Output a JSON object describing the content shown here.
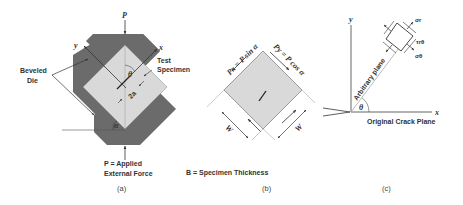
{
  "colors": {
    "die": "#6b6b6b",
    "specimen": "#d9d9d9",
    "line": "#333333",
    "text": "#333333",
    "background": "#ffffff"
  },
  "panel_a": {
    "force_top_label": "P",
    "axis_y_label": "y",
    "axis_x_label": "x",
    "die_label_line1": "Beveled",
    "die_label_line2": "Die",
    "specimen_label_line1": "Test",
    "specimen_label_line2": "Specimen",
    "angle_theta_label": "θ",
    "crack_length_label": "2a",
    "angle_alpha_label": "α",
    "force_def_line1": "P = Applied",
    "force_def_line2": "External Force",
    "caption": "(a)"
  },
  "panel_b": {
    "force_x_label": "Px = P sin α",
    "force_y_label": "Py = P cos α",
    "width_left_label": "W",
    "width_right_label": "W",
    "thickness_def": "B = Specimen Thickness",
    "caption": "(b)"
  },
  "panel_c": {
    "axis_y_label": "y",
    "axis_x_label": "x",
    "arbitrary_plane_label": "Arbitrary plane",
    "theta_label": "θ",
    "original_crack_label": "Original Crack Plane",
    "sigma_r_label": "σr",
    "tau_label": "τrθ",
    "sigma_theta_label": "σθ",
    "caption": "(c)"
  }
}
